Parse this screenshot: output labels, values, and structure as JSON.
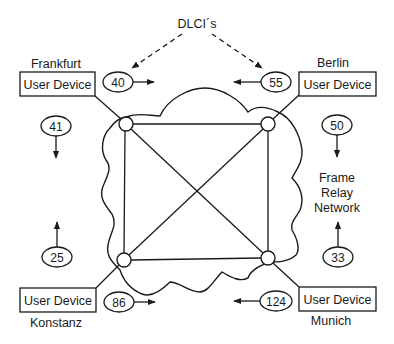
{
  "diagram": {
    "type": "frame-relay-network",
    "caption_top": "DLCI´s",
    "network_label": [
      "Frame",
      "Relay",
      "Network"
    ],
    "device_label": "User Device",
    "sites": [
      {
        "name": "Frankfurt",
        "position": "top-left",
        "device": "User Device",
        "outgoing_dlci": "40",
        "incoming_dlci": "41"
      },
      {
        "name": "Berlin",
        "position": "top-right",
        "device": "User Device",
        "outgoing_dlci": "55",
        "incoming_dlci": "50"
      },
      {
        "name": "Konstanz",
        "position": "bottom-left",
        "device": "User Device",
        "outgoing_dlci": "86",
        "incoming_dlci": "25"
      },
      {
        "name": "Munich",
        "position": "bottom-right",
        "device": "User Device",
        "outgoing_dlci": "124",
        "incoming_dlci": "33"
      }
    ],
    "dlci_values": {
      "top_left": "40",
      "top_right": "55",
      "left_top": "41",
      "left_bottom": "25",
      "right_top": "50",
      "right_bottom": "33",
      "bottom_left": "86",
      "bottom_right": "124"
    },
    "nodes": [
      "Frankfurt switch",
      "Berlin switch",
      "Konstanz switch",
      "Munich switch"
    ],
    "links": [
      [
        "Frankfurt switch",
        "Berlin switch"
      ],
      [
        "Frankfurt switch",
        "Konstanz switch"
      ],
      [
        "Berlin switch",
        "Munich switch"
      ],
      [
        "Konstanz switch",
        "Munich switch"
      ],
      [
        "Frankfurt switch",
        "Munich switch"
      ],
      [
        "Berlin switch",
        "Konstanz switch"
      ]
    ],
    "colors": {
      "line": "#1a1a1a",
      "background": "#ffffff"
    }
  }
}
